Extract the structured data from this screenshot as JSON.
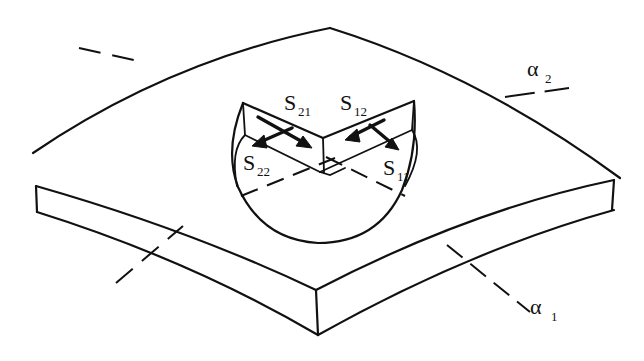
{
  "figure": {
    "axes": [
      {
        "symbol": "α",
        "subscript": "1",
        "label": "α1"
      },
      {
        "symbol": "α",
        "subscript": "2",
        "label": "α2"
      }
    ],
    "stress_labels": [
      {
        "base": "S",
        "subscript": "21",
        "label": "S21"
      },
      {
        "base": "S",
        "subscript": "12",
        "label": "S12"
      },
      {
        "base": "S",
        "subscript": "22",
        "label": "S22"
      },
      {
        "base": "S",
        "subscript": "11",
        "label": "S11"
      }
    ],
    "colors": {
      "line": "#111111",
      "background": "#ffffff"
    }
  }
}
